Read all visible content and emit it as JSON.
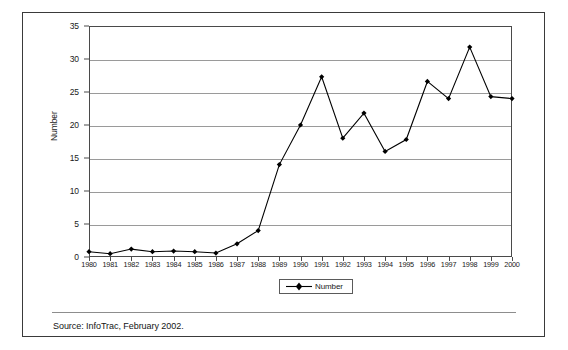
{
  "figure": {
    "source_note": "Source: InfoTrac, February 2002."
  },
  "legend": {
    "position": "below-plot",
    "entries": [
      {
        "label": "Number",
        "marker": "diamond-marker-icon",
        "color": "#000000"
      }
    ]
  },
  "chart_data": {
    "type": "line",
    "title": "",
    "subtitle": "",
    "xlabel": "",
    "ylabel": "Number",
    "xlim": [
      1980,
      2000
    ],
    "ylim": [
      0,
      35
    ],
    "yticks": [
      0,
      5,
      10,
      15,
      20,
      25,
      30,
      35
    ],
    "ytick_labels": [
      "0",
      "5",
      "10",
      "15",
      "20",
      "25",
      "30",
      "35"
    ],
    "grid": true,
    "grid_axis": "y",
    "legend_position": "bottom",
    "marker": "diamond",
    "line_color": "#000000",
    "categories": [
      "1980",
      "1981",
      "1982",
      "1983",
      "1984",
      "1985",
      "1986",
      "1987",
      "1988",
      "1989",
      "1990",
      "1991",
      "1992",
      "1993",
      "1994",
      "1995",
      "1996",
      "1997",
      "1998",
      "1999",
      "2000"
    ],
    "series": [
      {
        "name": "Number",
        "values": [
          0.8,
          0.5,
          1.2,
          0.8,
          0.9,
          0.8,
          0.6,
          2.0,
          4.0,
          14.0,
          20.0,
          27.3,
          18.0,
          21.8,
          16.0,
          17.8,
          26.6,
          24.0,
          31.8,
          24.3,
          24.0
        ]
      }
    ],
    "annotations": []
  }
}
